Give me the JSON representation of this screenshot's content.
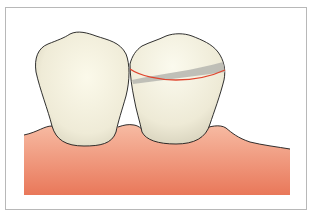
{
  "illustration": {
    "subject": "two teeth on gum line with fracture line on right tooth",
    "colors": {
      "frame_border": "#b8b8b8",
      "gum_top": "#f6b49c",
      "gum_bottom": "#ea7a5c",
      "tooth_light": "#f8f5e6",
      "tooth_shadow": "#d9d5c1",
      "fracture_shadow": "#b9b9b3",
      "fracture_line": "#e0452e",
      "outline": "#1a1a1a"
    }
  }
}
